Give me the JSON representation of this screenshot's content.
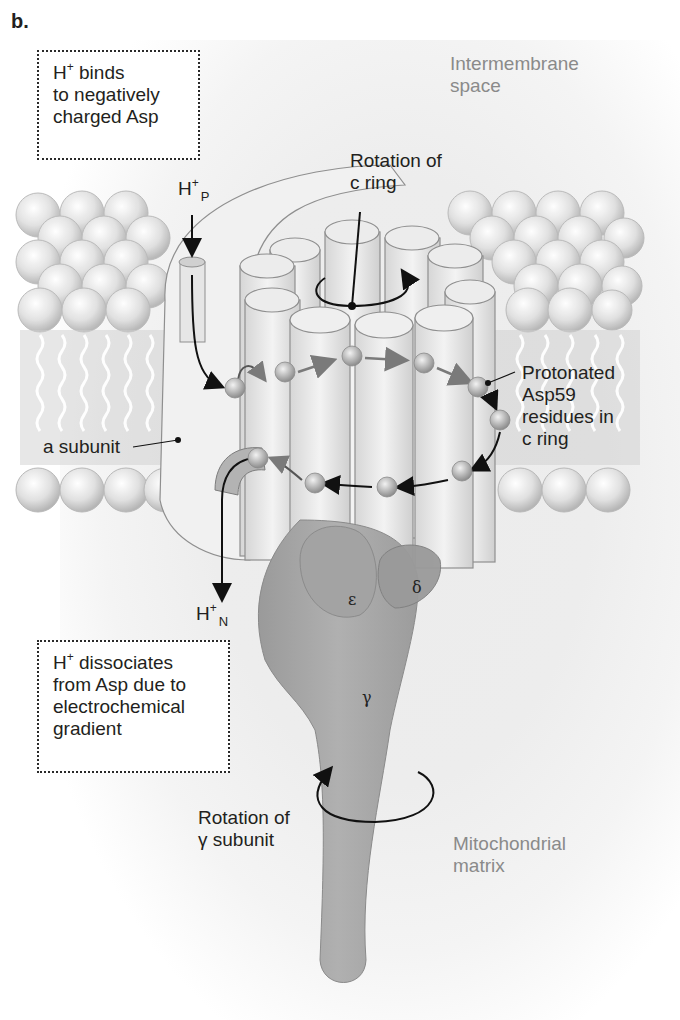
{
  "figure": {
    "panel_letter": "b.",
    "regions": {
      "intermembrane": "Intermembrane",
      "intermembrane_2": "space",
      "matrix": "Mitochondrial",
      "matrix_2": "matrix"
    },
    "callouts": {
      "binds": {
        "h": "H",
        "sup": "+",
        "line1_rest": " binds",
        "line2": "to negatively",
        "line3": "charged Asp"
      },
      "dissociates": {
        "h": "H",
        "sup": "+",
        "line1_rest": " dissociates",
        "line2": "from Asp due to",
        "line3": "electrochemical",
        "line4": "gradient"
      }
    },
    "labels": {
      "rotation_c_ring_1": "Rotation of",
      "rotation_c_ring_2": "c ring",
      "a_subunit": "a subunit",
      "protonated_1": "Protonated",
      "protonated_2": "Asp59",
      "protonated_3": "residues in",
      "protonated_4": "c ring",
      "rotation_gamma_1": "Rotation of",
      "rotation_gamma_2": "γ subunit"
    },
    "protons": {
      "p": {
        "h": "H",
        "sup": "+",
        "sub": "P"
      },
      "n": {
        "h": "H",
        "sup": "+",
        "sub": "N"
      }
    },
    "subunits": {
      "epsilon": "ε",
      "delta": "δ",
      "gamma": "γ"
    },
    "colors": {
      "lipid_head": "#d9d9d9",
      "protein_grey": "#a6a6a6",
      "cylinder_light": "#e8e8e8",
      "text_dark": "#231f20",
      "text_grey": "#8a8a8a"
    }
  }
}
